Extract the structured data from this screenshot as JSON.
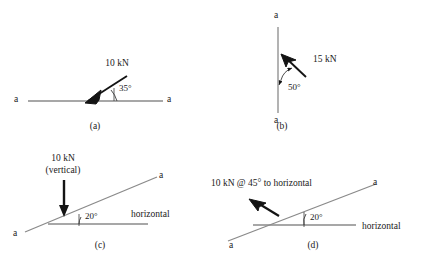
{
  "figure": {
    "background": "#ffffff",
    "line_color": "#8a8a8a",
    "arrow_color": "#141414",
    "text_color": "#1a1a1a",
    "panel_count": 4
  },
  "panels": [
    {
      "id": "a",
      "caption": "(a)",
      "member_type": "horizontal",
      "end_label_left": "a",
      "end_label_right": "a",
      "force_label": "10 kN",
      "angle_label": "35°",
      "angle_value": 35,
      "force_value": "10 kN",
      "force_direction": "down-left"
    },
    {
      "id": "b",
      "caption": "(b)",
      "member_type": "vertical",
      "end_label_top": "a",
      "end_label_bottom": "a",
      "force_label": "15 kN",
      "angle_label": "50°",
      "angle_value": 50,
      "force_value": "15 kN",
      "force_direction": "up-left"
    },
    {
      "id": "c",
      "caption": "(c)",
      "member_type": "inclined",
      "end_label_left": "a",
      "end_label_right": "a",
      "force_label_line1": "10 kN",
      "force_label_line2": "(vertical)",
      "angle_label": "20°",
      "angle_value": 20,
      "reference_label": "horizontal",
      "force_direction": "down"
    },
    {
      "id": "d",
      "caption": "(d)",
      "member_type": "inclined",
      "end_label_left": "a",
      "end_label_right": "a",
      "force_label": "10 kN @ 45° to horizontal",
      "angle_label": "20°",
      "angle_value": 20,
      "reference_label": "horizontal",
      "force_direction": "up-left-45"
    }
  ]
}
